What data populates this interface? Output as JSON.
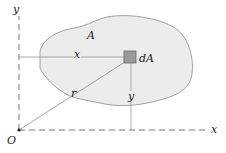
{
  "diagram": {
    "labels": {
      "y_axis": "y",
      "x_axis": "x",
      "origin": "O",
      "area": "A",
      "element": "dA",
      "x_distance": "x",
      "y_distance": "y",
      "radius": "r"
    },
    "colors": {
      "area_fill": "#ececec",
      "area_stroke": "#8a8a8a",
      "element_fill": "#9a9a9a",
      "axis": "#777777",
      "text": "#222222"
    }
  }
}
